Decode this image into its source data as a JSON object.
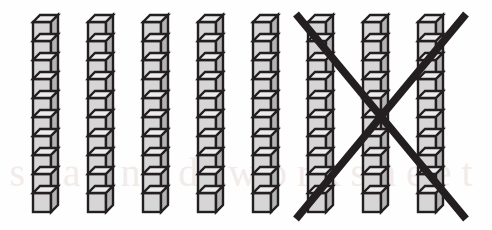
{
  "figure": {
    "background_color": "#fefefe",
    "width": 492,
    "height": 230,
    "watermark_text": "scanned worksheet"
  },
  "manipulative": {
    "type": "base-ten-rods",
    "cube_fill_color": "#d6d6d6",
    "cube_top_color": "#ececec",
    "cube_side_color": "#b4b4b4",
    "outline_color": "#231f20",
    "cubes_per_rod": 10,
    "total_rods": 8,
    "total_cubes": 80,
    "crossed_out_rods": 3,
    "crossed_out_cubes": 30,
    "remaining_rods": 5,
    "remaining_cubes": 50,
    "rod_face_width": 18,
    "rod_depth": 7,
    "cube_face_height": 19,
    "rod_top_y": 15,
    "rods": [
      {
        "index": 1,
        "x": 33,
        "crossed_out": false
      },
      {
        "index": 2,
        "x": 88,
        "crossed_out": false
      },
      {
        "index": 3,
        "x": 143,
        "crossed_out": false
      },
      {
        "index": 4,
        "x": 198,
        "crossed_out": false
      },
      {
        "index": 5,
        "x": 253,
        "crossed_out": false
      },
      {
        "index": 6,
        "x": 308,
        "crossed_out": true
      },
      {
        "index": 7,
        "x": 363,
        "crossed_out": true
      },
      {
        "index": 8,
        "x": 418,
        "crossed_out": true
      }
    ]
  },
  "cross_out": {
    "label": "x-mark",
    "color": "#231f20",
    "stroke_width": 7.5,
    "left": 296,
    "right": 466,
    "top": 14,
    "bottom": 219,
    "center_x": 381,
    "center_y": 116
  }
}
